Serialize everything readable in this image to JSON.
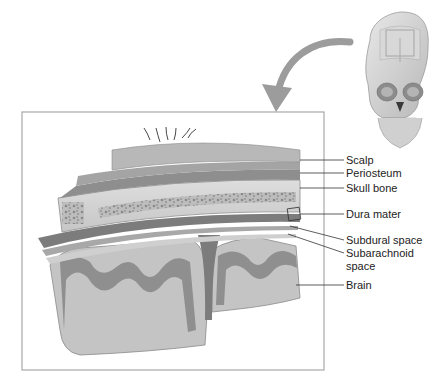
{
  "diagram": {
    "labels": [
      {
        "id": "scalp",
        "text": "Scalp",
        "x": 346,
        "y": 160
      },
      {
        "id": "periosteum",
        "text": "Periosteum",
        "x": 346,
        "y": 173
      },
      {
        "id": "skull-bone",
        "text": "Skull bone",
        "x": 346,
        "y": 188
      },
      {
        "id": "dura-mater",
        "text": "Dura mater",
        "x": 346,
        "y": 214
      },
      {
        "id": "subdural-space",
        "text": "Subdural space",
        "x": 346,
        "y": 240
      },
      {
        "id": "subarachnoid-space-1",
        "text": "Subarachnoid",
        "x": 346,
        "y": 253
      },
      {
        "id": "subarachnoid-space-2",
        "text": "space",
        "x": 346,
        "y": 266
      },
      {
        "id": "brain",
        "text": "Brain",
        "x": 346,
        "y": 285
      }
    ],
    "colors": {
      "scalp": "#b8b8b8",
      "periosteum": "#8e8e8e",
      "bone": "#d2d2d2",
      "marrow": "#9a9a9a",
      "dura": "#7c7c7c",
      "gray_matter": "#8a8a8a",
      "white_matter": "#c4c4c4",
      "frame": "#a8a8a8",
      "arrow": "#9c9c9c"
    }
  }
}
